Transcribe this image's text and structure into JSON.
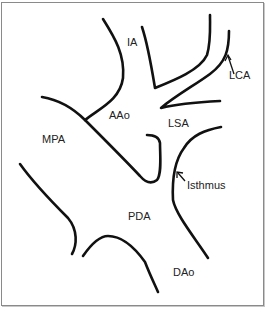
{
  "figure": {
    "type": "anatomical line diagram",
    "labels": {
      "ia": "IA",
      "lca": "LCA",
      "aao": "AAo",
      "lsa": "LSA",
      "mpa": "MPA",
      "isthmus": "Isthmus",
      "pda": "PDA",
      "dao": "DAo"
    },
    "colors": {
      "stroke": "#111111",
      "border": "#8a8a8a",
      "background": "#ffffff"
    }
  }
}
